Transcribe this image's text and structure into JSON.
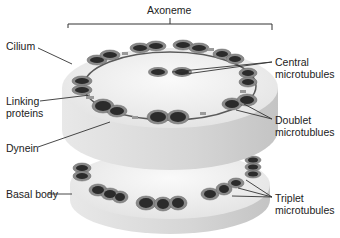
{
  "diagram": {
    "colors": {
      "disc_top": "#efefef",
      "disc_side": "#dcdcdc",
      "tubule_outer": "#8a8a8a",
      "tubule_inner": "#2b2b2b",
      "link": "#9a9a9a",
      "line": "#333333"
    },
    "labels": {
      "axoneme": "Axoneme",
      "cilium": "Cilium",
      "linking_proteins": "Linking proteins",
      "dynein": "Dynein",
      "basal_body": "Basal body",
      "central_microtubules": "Central microtubules",
      "doublet_microtubules": "Doublet microtublues",
      "triplet_microtubules": "Triplet microtubules"
    }
  }
}
